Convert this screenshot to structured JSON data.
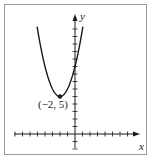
{
  "chart_data": {
    "type": "line",
    "title": "",
    "function": "y = (x + 2)^2 + 5",
    "xlabel": "x",
    "ylabel": "y",
    "xlim": [
      -8,
      8
    ],
    "ylim": [
      -2,
      15
    ],
    "grid": false,
    "legend": null,
    "tick_spacing": 1,
    "x": [
      -5,
      -4,
      -3,
      -2,
      -1,
      0,
      1
    ],
    "series": [
      {
        "name": "parabola",
        "values": [
          14,
          9,
          6,
          5,
          6,
          9,
          14
        ]
      }
    ],
    "annotations": [
      {
        "text": "(−2, 5)",
        "point": [
          -2,
          5
        ],
        "marker": "filled-dot"
      }
    ]
  },
  "labels": {
    "x_axis": "x",
    "y_axis": "y",
    "vertex": "(−2, 5)"
  },
  "colors": {
    "curve": "#1a1a1a",
    "axes": "#1a1a1a",
    "frame": "#999999"
  }
}
